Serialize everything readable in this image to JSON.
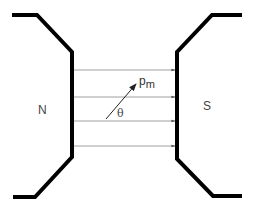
{
  "diagram": {
    "title": "",
    "poles": [
      {
        "id": "north",
        "label": "N"
      },
      {
        "id": "south",
        "label": "S"
      }
    ],
    "field_lines": {
      "count": 4,
      "direction": "N to S (left to right)",
      "y_positions": [
        70,
        97,
        121,
        146
      ]
    },
    "vector": {
      "label_main": "p",
      "label_sub": "m",
      "angle_label": "θ"
    },
    "colors": {
      "pole": "#000000",
      "field_line": "#888888",
      "vector": "#222222",
      "text": "#444444"
    }
  }
}
